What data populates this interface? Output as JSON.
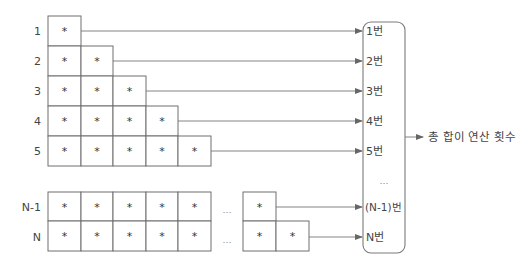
{
  "diagram": {
    "type": "triangular-operation-count",
    "cell_symbol": "*",
    "row_labels": [
      "1",
      "2",
      "3",
      "4",
      "5",
      "N-1",
      "N"
    ],
    "gap_ellipsis": "…",
    "outputs": [
      "1번",
      "2번",
      "3번",
      "4번",
      "5번",
      "…",
      "(N-1)번",
      "N번"
    ],
    "result_label": "총 합이 연산 횟수",
    "colors": {
      "line": "#777777",
      "cell_border": "#6f6f6f",
      "text": "#444444",
      "background": "#ffffff"
    }
  }
}
